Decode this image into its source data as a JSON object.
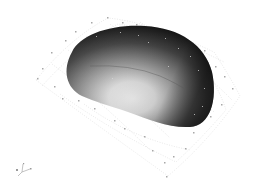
{
  "scene": {
    "background": "#ffffff",
    "object": {
      "label": "3D rendered blob",
      "shading_dark": "#141414",
      "shading_light": "#f4f4f4"
    },
    "grid": {
      "color": "#c8c8c8",
      "marker_color": "#a0a0a0"
    },
    "axis_triad": {
      "labels": [
        "x",
        "y",
        "z"
      ]
    }
  }
}
